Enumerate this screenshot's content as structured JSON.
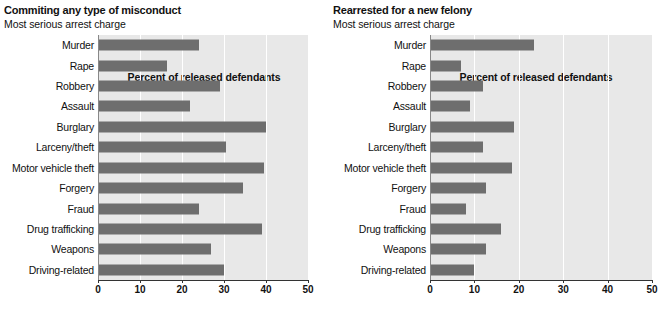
{
  "chart_data": [
    {
      "type": "bar",
      "orientation": "horizontal",
      "title": "Commiting any type of misconduct",
      "subtitle": "Most serious arrest charge",
      "xlabel": "Percent of released defendants",
      "ylabel": "",
      "xlim": [
        0,
        50
      ],
      "xticks": [
        0,
        10,
        20,
        30,
        40,
        50
      ],
      "xtick_labels": [
        "0",
        "10",
        "20",
        "30",
        "40",
        "50"
      ],
      "grid": true,
      "legend": "none",
      "bar_color": "#6e6e6e",
      "plot_background": "#e8e8e8",
      "categories": [
        "Murder",
        "Rape",
        "Robbery",
        "Assault",
        "Burglary",
        "Larceny/theft",
        "Motor vehicle theft",
        "Forgery",
        "Fraud",
        "Drug trafficking",
        "Weapons",
        "Driving-related"
      ],
      "values": [
        24,
        16.5,
        29,
        22,
        40,
        30.5,
        39.5,
        34.5,
        24,
        39,
        27,
        30
      ]
    },
    {
      "type": "bar",
      "orientation": "horizontal",
      "title": "Rearrested for a new felony",
      "subtitle": "Most serious arrest charge",
      "xlabel": "Percent of released defendants",
      "ylabel": "",
      "xlim": [
        0,
        50
      ],
      "xticks": [
        0,
        10,
        20,
        30,
        40,
        50
      ],
      "xtick_labels": [
        "0",
        "10",
        "20",
        "30",
        "40",
        "50"
      ],
      "grid": true,
      "legend": "none",
      "bar_color": "#6e6e6e",
      "plot_background": "#e8e8e8",
      "categories": [
        "Murder",
        "Rape",
        "Robbery",
        "Assault",
        "Burglary",
        "Larceny/theft",
        "Motor vehicle theft",
        "Forgery",
        "Fraud",
        "Drug trafficking",
        "Weapons",
        "Driving-related"
      ],
      "values": [
        23.5,
        7,
        12,
        9,
        19,
        12,
        18.5,
        12.5,
        8,
        16,
        12.5,
        10
      ]
    }
  ]
}
